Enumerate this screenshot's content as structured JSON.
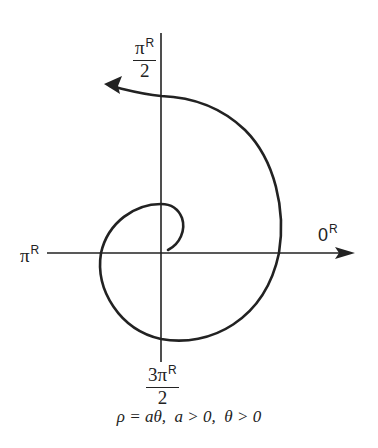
{
  "diagram": {
    "type": "polar-spiral",
    "axes": {
      "right": {
        "value": "0",
        "superscript": "R"
      },
      "top": {
        "numerator": "π",
        "denominator": "2",
        "superscript": "R"
      },
      "left": {
        "value": "π",
        "superscript": "R"
      },
      "bottom": {
        "numerator": "3π",
        "denominator": "2",
        "superscript": "R"
      }
    },
    "caption": {
      "equation": "ρ = aθ,",
      "condition_a": "a > 0,",
      "condition_theta": "θ > 0"
    },
    "colors": {
      "stroke": "#222222",
      "background": "#ffffff"
    }
  }
}
